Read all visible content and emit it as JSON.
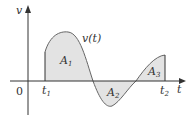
{
  "diagram": {
    "axes": {
      "y_label": "v",
      "x_label": "t",
      "origin_label": "0"
    },
    "curve_label": "v(t)",
    "ticks": [
      {
        "label": "t",
        "sub": "1"
      },
      {
        "label": "t",
        "sub": "2"
      }
    ],
    "areas": [
      {
        "label": "A",
        "sub": "1"
      },
      {
        "label": "A",
        "sub": "2"
      },
      {
        "label": "A",
        "sub": "3"
      }
    ],
    "colors": {
      "fill": "#e3e3e3",
      "stroke": "#555555",
      "axis": "#333333"
    }
  }
}
